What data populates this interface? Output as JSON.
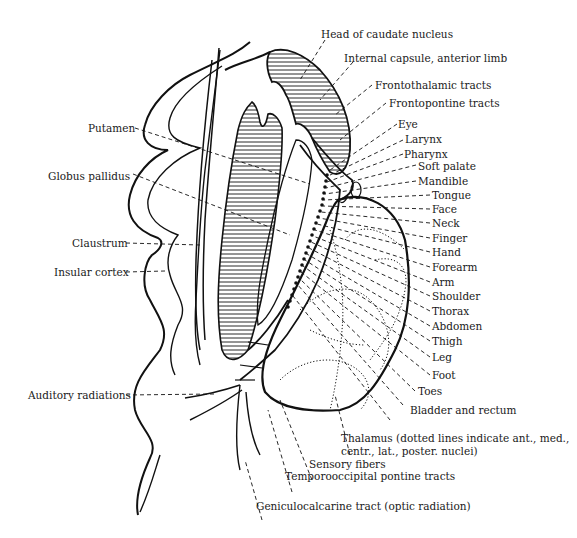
{
  "figure": {
    "labels": {
      "head_of_caudate": "Head of caudate nucleus",
      "internal_capsule_anterior": "Internal capsule, anterior limb",
      "frontothalamic": "Frontothalamic tracts",
      "frontopontine": "Frontopontine tracts",
      "eye": "Eye",
      "larynx": "Larynx",
      "pharynx": "Pharynx",
      "soft_palate": "Soft palate",
      "mandible": "Mandible",
      "tongue": "Tongue",
      "face": "Face",
      "neck": "Neck",
      "finger": "Finger",
      "hand": "Hand",
      "forearm": "Forearm",
      "arm": "Arm",
      "shoulder": "Shoulder",
      "thorax": "Thorax",
      "abdomen": "Abdomen",
      "thigh": "Thigh",
      "leg": "Leg",
      "foot": "Foot",
      "toes": "Toes",
      "bladder_rectum": "Bladder and rectum",
      "thalamus_line1": "Thalamus (dotted lines indicate ant., med.,",
      "thalamus_line2": "centr., lat., poster. nuclei)",
      "sensory_fibers": "Sensory fibers",
      "temporooccipital": "Temporooccipital pontine tracts",
      "geniculocalcarine": "Geniculocalcarine tract (optic radiation)",
      "putamen": "Putamen",
      "globus_pallidus": "Globus pallidus",
      "claustrum": "Claustrum",
      "insular_cortex": "Insular cortex",
      "auditory_radiations": "Auditory radiations"
    }
  }
}
